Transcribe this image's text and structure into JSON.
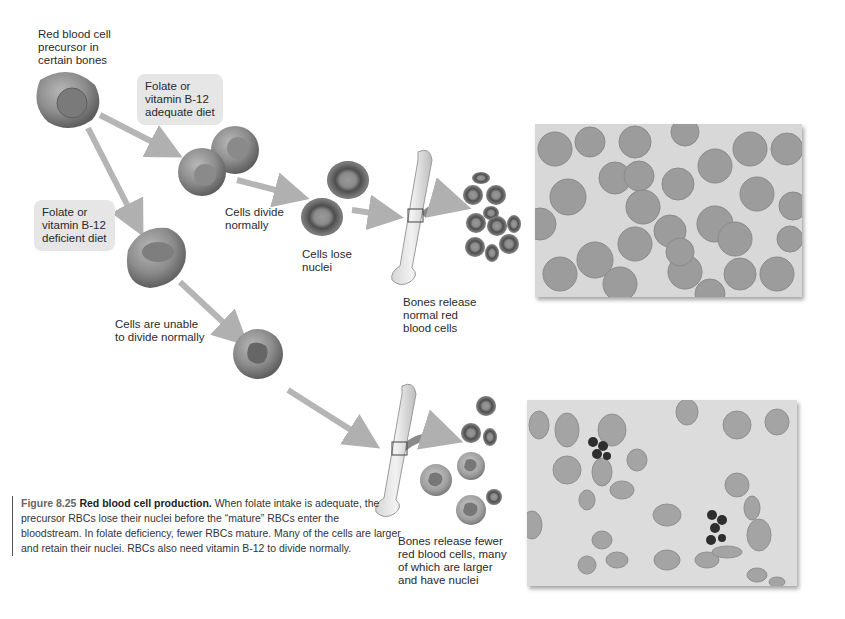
{
  "diagram": {
    "title": "Red blood cell production",
    "labels": {
      "precursor": "Red blood cell\nprecursor in\ncertain bones",
      "adequate_diet": "Folate or\nvitamin B-12\nadequate diet",
      "deficient_diet": "Folate or\nvitamin B-12\ndeficient diet",
      "cells_divide": "Cells divide\nnormally",
      "cells_lose_nuclei": "Cells lose\nnuclei",
      "bones_release_normal": "Bones release\nnormal red\nblood cells",
      "cells_unable": "Cells are unable\nto divide normally",
      "bones_release_fewer": "Bones release fewer\nred blood cells, many\nof which are larger\nand have nuclei"
    },
    "photos": {
      "normal": "Micrograph of normal red blood cells",
      "deficient": "Micrograph of blood in folate deficiency with large cells and nuclei"
    }
  },
  "caption": {
    "figure_number": "Figure 8.25",
    "title": "Red blood cell production.",
    "text": " When folate intake is adequate, the precursor RBCs lose their nuclei before the “mature” RBCs enter the bloodstream. In folate deficiency, fewer RBCs mature. Many of the cells are larger and retain their nuclei. RBCs also need vitamin B-12 to divide normally."
  },
  "colors": {
    "background": "#ffffff",
    "label_box": "#e6e6e6",
    "cell": "#8a8a8a",
    "arrow": "#b5b5b5",
    "photo_bg": "#d8d8d8"
  }
}
